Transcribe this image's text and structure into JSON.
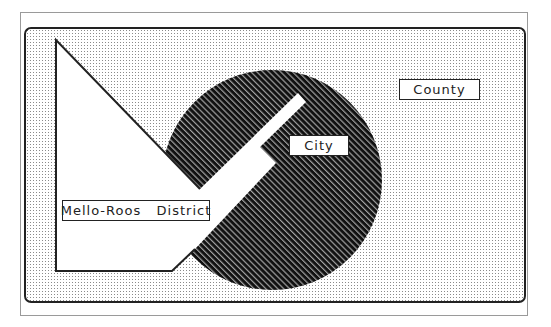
{
  "diagram": {
    "title": "",
    "regions": [
      {
        "id": "county",
        "label": "County",
        "fill": "dotted"
      },
      {
        "id": "city",
        "label": "City",
        "fill": "diagonal-hatch"
      },
      {
        "id": "mello-roos",
        "label": "Mello-Roos   District",
        "fill": "white"
      }
    ]
  },
  "labels": {
    "county": "County",
    "city": "City",
    "mello_roos": "Mello-Roos   District"
  },
  "colors": {
    "outline": "#222222",
    "frame": "#9a9a9a",
    "dot": "#8a8a8a",
    "hatch_dark": "#111111",
    "hatch_light": "#9a9a9a"
  }
}
